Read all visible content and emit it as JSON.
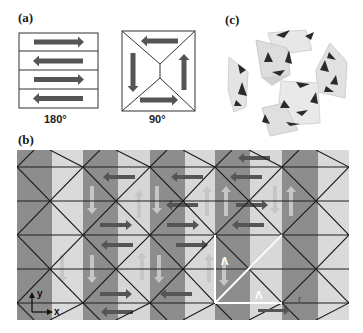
{
  "figure": {
    "panel_a": {
      "label": "(a)",
      "domain_180": {
        "caption": "180°",
        "stripes": [
          "right",
          "left",
          "right",
          "left"
        ]
      },
      "domain_90": {
        "caption": "90°",
        "arrows": [
          "left",
          "up",
          "right",
          "down"
        ]
      }
    },
    "panel_b": {
      "label": "(b)",
      "axis_labels": {
        "y": "y",
        "x": "x"
      },
      "annotations": {
        "lambda_1": "Λ",
        "lambda_2": "Λ",
        "r": "r"
      }
    },
    "panel_c": {
      "label": "(c)",
      "description": "3D rendered cluster of translucent octahedra with dark cone-shaped dipole markers"
    },
    "colors": {
      "dark_stripe": "#8c8c8c",
      "mid_stripe": "#b7b7b7",
      "light_stripe": "#d9d9d9",
      "arrow_dark": "#555555",
      "arrow_light": "#c4c4c4",
      "grid_line": "#1e1e1e",
      "highlight": "#ffffff"
    }
  }
}
